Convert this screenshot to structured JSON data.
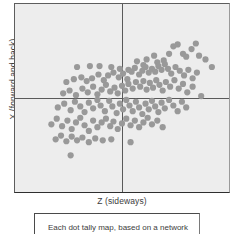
{
  "figure": {
    "name": "scatter-plot-figure"
  },
  "chart_data": {
    "type": "scatter",
    "title": "",
    "xlabel": "Z (sideways)",
    "ylabel": "X (forward and back)",
    "xlim": [
      -1,
      1
    ],
    "ylim": [
      -1,
      1
    ],
    "grid": false,
    "legend": null,
    "crosshair": {
      "x": 0,
      "y": 0,
      "color": "#5a5a5a"
    },
    "marker": {
      "color": "#999999",
      "size": 3.1,
      "shape": "circle"
    },
    "plot_background": "#ededed",
    "points": [
      [
        -0.42,
        0.33
      ],
      [
        -0.3,
        0.34
      ],
      [
        -0.21,
        0.34
      ],
      [
        -0.1,
        0.33
      ],
      [
        -0.02,
        0.31
      ],
      [
        0.06,
        0.3
      ],
      [
        0.14,
        0.39
      ],
      [
        0.2,
        0.35
      ],
      [
        0.23,
        0.41
      ],
      [
        0.3,
        0.45
      ],
      [
        0.33,
        0.38
      ],
      [
        0.39,
        0.4
      ],
      [
        0.44,
        0.47
      ],
      [
        0.48,
        0.55
      ],
      [
        0.52,
        0.57
      ],
      [
        0.57,
        0.47
      ],
      [
        0.6,
        0.44
      ],
      [
        0.65,
        0.52
      ],
      [
        0.69,
        0.58
      ],
      [
        0.72,
        0.45
      ],
      [
        0.78,
        0.41
      ],
      [
        0.84,
        0.33
      ],
      [
        -0.52,
        0.17
      ],
      [
        -0.45,
        0.2
      ],
      [
        -0.38,
        0.22
      ],
      [
        -0.33,
        0.18
      ],
      [
        -0.28,
        0.21
      ],
      [
        -0.22,
        0.25
      ],
      [
        -0.17,
        0.19
      ],
      [
        -0.13,
        0.24
      ],
      [
        -0.08,
        0.27
      ],
      [
        -0.03,
        0.22
      ],
      [
        0.01,
        0.26
      ],
      [
        0.05,
        0.2
      ],
      [
        0.09,
        0.28
      ],
      [
        0.12,
        0.32
      ],
      [
        0.16,
        0.25
      ],
      [
        0.19,
        0.29
      ],
      [
        0.22,
        0.33
      ],
      [
        0.25,
        0.27
      ],
      [
        0.28,
        0.31
      ],
      [
        0.31,
        0.28
      ],
      [
        0.34,
        0.34
      ],
      [
        0.37,
        0.3
      ],
      [
        0.4,
        0.36
      ],
      [
        0.43,
        0.31
      ],
      [
        0.46,
        0.26
      ],
      [
        0.5,
        0.33
      ],
      [
        0.54,
        0.29
      ],
      [
        0.58,
        0.24
      ],
      [
        0.62,
        0.3
      ],
      [
        0.66,
        0.21
      ],
      [
        0.7,
        0.27
      ],
      [
        -0.55,
        0.05
      ],
      [
        -0.49,
        0.08
      ],
      [
        -0.43,
        0.03
      ],
      [
        -0.37,
        0.1
      ],
      [
        -0.32,
        0.06
      ],
      [
        -0.27,
        0.12
      ],
      [
        -0.23,
        0.04
      ],
      [
        -0.19,
        0.09
      ],
      [
        -0.15,
        0.14
      ],
      [
        -0.11,
        0.07
      ],
      [
        -0.07,
        0.11
      ],
      [
        -0.04,
        0.05
      ],
      [
        0.0,
        0.13
      ],
      [
        0.03,
        0.08
      ],
      [
        0.06,
        0.15
      ],
      [
        0.1,
        0.1
      ],
      [
        0.13,
        0.17
      ],
      [
        0.17,
        0.12
      ],
      [
        0.2,
        0.18
      ],
      [
        0.23,
        0.09
      ],
      [
        0.26,
        0.16
      ],
      [
        0.29,
        0.11
      ],
      [
        0.32,
        0.19
      ],
      [
        0.35,
        0.14
      ],
      [
        0.38,
        0.08
      ],
      [
        0.41,
        0.17
      ],
      [
        0.45,
        0.12
      ],
      [
        0.49,
        0.19
      ],
      [
        0.53,
        0.1
      ],
      [
        0.57,
        0.15
      ],
      [
        0.61,
        0.06
      ],
      [
        0.66,
        0.12
      ],
      [
        0.74,
        0.02
      ],
      [
        -0.6,
        -0.1
      ],
      [
        -0.54,
        -0.06
      ],
      [
        -0.48,
        -0.13
      ],
      [
        -0.44,
        -0.04
      ],
      [
        -0.39,
        -0.09
      ],
      [
        -0.35,
        -0.15
      ],
      [
        -0.31,
        -0.05
      ],
      [
        -0.27,
        -0.11
      ],
      [
        -0.23,
        -0.02
      ],
      [
        -0.2,
        -0.08
      ],
      [
        -0.16,
        -0.14
      ],
      [
        -0.12,
        -0.03
      ],
      [
        -0.09,
        -0.09
      ],
      [
        -0.05,
        -0.16
      ],
      [
        -0.02,
        -0.06
      ],
      [
        0.01,
        -0.12
      ],
      [
        0.04,
        -0.02
      ],
      [
        0.07,
        -0.08
      ],
      [
        0.1,
        -0.14
      ],
      [
        0.13,
        -0.04
      ],
      [
        0.16,
        -0.1
      ],
      [
        0.19,
        -0.17
      ],
      [
        0.22,
        -0.06
      ],
      [
        0.25,
        -0.12
      ],
      [
        0.28,
        -0.03
      ],
      [
        0.31,
        -0.09
      ],
      [
        0.34,
        -0.15
      ],
      [
        0.37,
        -0.05
      ],
      [
        0.4,
        -0.11
      ],
      [
        0.44,
        -0.02
      ],
      [
        0.48,
        -0.08
      ],
      [
        0.52,
        -0.14
      ],
      [
        0.56,
        -0.04
      ],
      [
        0.6,
        -0.1
      ],
      [
        -0.66,
        -0.28
      ],
      [
        -0.61,
        -0.22
      ],
      [
        -0.56,
        -0.3
      ],
      [
        -0.51,
        -0.24
      ],
      [
        -0.47,
        -0.33
      ],
      [
        -0.43,
        -0.26
      ],
      [
        -0.39,
        -0.21
      ],
      [
        -0.35,
        -0.29
      ],
      [
        -0.31,
        -0.35
      ],
      [
        -0.27,
        -0.24
      ],
      [
        -0.23,
        -0.31
      ],
      [
        -0.19,
        -0.26
      ],
      [
        -0.15,
        -0.22
      ],
      [
        -0.11,
        -0.3
      ],
      [
        -0.08,
        -0.25
      ],
      [
        -0.04,
        -0.33
      ],
      [
        0.0,
        -0.27
      ],
      [
        0.04,
        -0.22
      ],
      [
        0.08,
        -0.29
      ],
      [
        0.12,
        -0.24
      ],
      [
        0.16,
        -0.31
      ],
      [
        0.2,
        -0.26
      ],
      [
        0.24,
        -0.21
      ],
      [
        0.28,
        -0.28
      ],
      [
        0.33,
        -0.24
      ],
      [
        0.38,
        -0.31
      ],
      [
        -0.62,
        -0.44
      ],
      [
        -0.57,
        -0.4
      ],
      [
        -0.52,
        -0.46
      ],
      [
        -0.47,
        -0.41
      ],
      [
        -0.42,
        -0.45
      ],
      [
        -0.37,
        -0.42
      ],
      [
        -0.31,
        -0.47
      ],
      [
        -0.25,
        -0.43
      ],
      [
        -0.18,
        -0.45
      ],
      [
        -0.1,
        -0.44
      ],
      [
        0.08,
        -0.47
      ],
      [
        -0.48,
        -0.61
      ]
    ]
  },
  "caption": {
    "text": "Each dot tally map, based on a network"
  }
}
